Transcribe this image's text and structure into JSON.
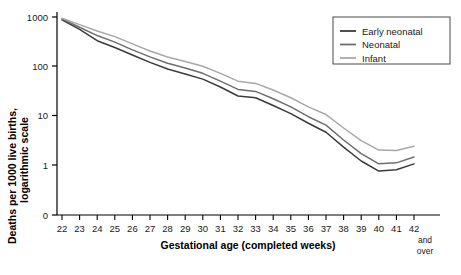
{
  "chart_data": {
    "type": "line",
    "title": "",
    "xlabel": "Gestational age (completed weeks)",
    "ylabel": "Deaths per 1000 live births, logarithmic scale",
    "yscale": "log",
    "ylim": [
      0.4,
      1000
    ],
    "grid": false,
    "legend_position": "top-right",
    "y_ticks": [
      "1000",
      "100",
      "10",
      "1",
      "0"
    ],
    "y_tick_values": [
      1000,
      100,
      10,
      1,
      0
    ],
    "categories": [
      "22",
      "23",
      "24",
      "25",
      "26",
      "27",
      "28",
      "29",
      "30",
      "31",
      "32",
      "33",
      "34",
      "35",
      "36",
      "37",
      "38",
      "39",
      "40",
      "41",
      "42"
    ],
    "last_category_note": [
      "and",
      "over"
    ],
    "series": [
      {
        "name": "Early neonatal",
        "color": "#3b3b3b",
        "values": [
          880,
          560,
          330,
          240,
          170,
          120,
          88,
          70,
          55,
          38,
          25,
          23,
          16,
          11,
          7.0,
          4.6,
          2.3,
          1.2,
          0.75,
          0.8,
          1.05
        ]
      },
      {
        "name": "Neonatal",
        "color": "#6e6e6e",
        "values": [
          915,
          620,
          420,
          310,
          215,
          155,
          115,
          92,
          72,
          50,
          34,
          31,
          22,
          15,
          9.5,
          6.4,
          3.2,
          1.7,
          1.05,
          1.1,
          1.45
        ]
      },
      {
        "name": "Infant",
        "color": "#a8a8a8",
        "values": [
          940,
          700,
          520,
          400,
          285,
          205,
          155,
          125,
          100,
          72,
          50,
          45,
          33,
          23,
          15,
          10.5,
          5.6,
          3.1,
          2.0,
          1.95,
          2.4
        ]
      }
    ]
  },
  "legend": {
    "items": [
      {
        "label": "Early neonatal"
      },
      {
        "label": "Neonatal"
      },
      {
        "label": "Infant"
      }
    ]
  }
}
